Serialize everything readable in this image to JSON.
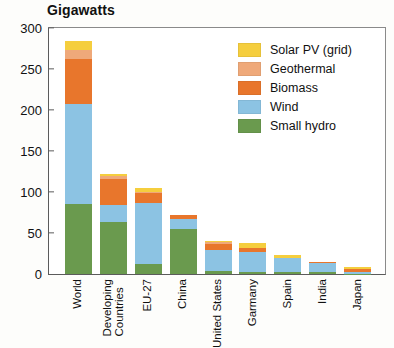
{
  "chart_data": {
    "type": "bar",
    "subtype": "stacked-bar",
    "title": "Gigawatts",
    "xlabel": "",
    "ylabel": "Gigawatts",
    "ylim": [
      0,
      300
    ],
    "yticks": [
      0,
      50,
      100,
      150,
      200,
      250,
      300
    ],
    "grid": false,
    "legend_position": "top-right",
    "categories": [
      "World",
      "Developing Countries",
      "EU-27",
      "China",
      "United States",
      "Garmany",
      "Spain",
      "India",
      "Japan"
    ],
    "series": [
      {
        "name": "Small hydro",
        "color": "#6a9a4e",
        "values": [
          85,
          63,
          12,
          55,
          4,
          2,
          2,
          2,
          0.5
        ]
      },
      {
        "name": "Wind",
        "color": "#8cc3e3",
        "values": [
          121,
          21,
          74,
          12,
          25,
          25,
          17,
          11,
          2
        ]
      },
      {
        "name": "Biomass",
        "color": "#e8762c",
        "values": [
          54,
          31,
          12,
          4,
          7,
          5,
          1,
          2,
          3
        ]
      },
      {
        "name": "Geothermal",
        "color": "#efa97a",
        "values": [
          11,
          4,
          1,
          0,
          3,
          0,
          0,
          0,
          0.5
        ]
      },
      {
        "name": "Solar PV (grid)",
        "color": "#f5ce3e",
        "values": [
          11,
          2,
          5,
          0,
          1,
          5,
          3,
          0,
          3
        ]
      }
    ],
    "totals": [
      282,
      121,
      104,
      71,
      40,
      37,
      23,
      15,
      9
    ],
    "legend": [
      {
        "label": "Solar PV (grid)",
        "color": "#f5ce3e"
      },
      {
        "label": "Geothermal",
        "color": "#efa97a"
      },
      {
        "label": "Biomass",
        "color": "#e8762c"
      },
      {
        "label": "Wind",
        "color": "#8cc3e3"
      },
      {
        "label": "Small hydro",
        "color": "#6a9a4e"
      }
    ]
  },
  "labels": {
    "category_lines": [
      [
        "World"
      ],
      [
        "Developing",
        "Countries"
      ],
      [
        "EU-27"
      ],
      [
        "China"
      ],
      [
        "United States"
      ],
      [
        "Garmany"
      ],
      [
        "Spain"
      ],
      [
        "India"
      ],
      [
        "Japan"
      ]
    ]
  }
}
